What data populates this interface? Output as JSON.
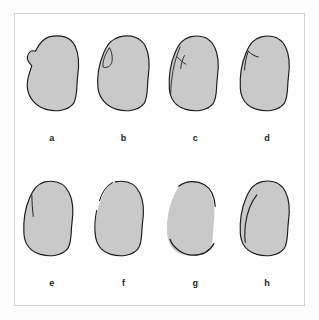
{
  "figure": {
    "background_color": "#fdfdfd",
    "frame_color": "#d2d2d2",
    "fill_color": "#c9c9c9",
    "outline_color": "#1a1a1a",
    "label_color": "#1d1d1d",
    "rows": 2,
    "columns": 4
  },
  "panels": [
    {
      "label": "a",
      "name": "seed-outline-a",
      "description": "full kidney-bean outline with concave notch on upper left margin",
      "outline": "M 46 8 C 62 4 76 8 82 20 C 88 32 88 48 86 62 C 84 78 86 92 80 101 C 72 111 56 113 42 109 C 28 105 18 94 16 80 C 14 66 20 56 22 48 C 18 44 15 40 16 35 C 17 29 22 26 27 28 C 30 22 36 11 46 8 Z",
      "marks": []
    },
    {
      "label": "b",
      "name": "seed-outline-b",
      "description": "bean outline with small pointed flap at upper left hilum",
      "outline": "M 44 8 C 60 4 74 9 80 21 C 86 33 86 49 84 63 C 82 79 84 92 78 101 C 70 111 54 113 40 109 C 26 105 16 94 14 80 C 12 62 16 44 22 30 C 28 16 34 11 44 8 Z",
      "marks": [
        "M 30 23 C 24 32 20 42 21 50 C 26 52 31 49 33 44 C 35 37 33 29 30 23 Z"
      ]
    },
    {
      "label": "c",
      "name": "seed-outline-c",
      "description": "bean outline with X-shaped cross mark and descending line at upper left",
      "outline": "M 42 8 C 58 4 70 10 76 22 C 82 34 82 50 80 64 C 78 80 80 92 74 101 C 66 111 50 113 36 109 C 22 105 14 94 13 80 C 12 62 15 44 21 30 C 27 16 32 11 42 8 Z",
      "marks": [
        "M 28 22 C 24 32 20 44 18 56 C 16 68 15 78 15 86",
        "M 24 36 C 28 40 32 44 36 46",
        "M 34 34 C 31 40 29 47 29 52"
      ]
    },
    {
      "label": "d",
      "name": "seed-outline-d",
      "description": "bean outline with small hook mark at upper left",
      "outline": "M 42 8 C 58 4 70 10 76 22 C 82 34 82 50 80 64 C 78 80 80 92 74 101 C 66 111 50 113 36 109 C 22 105 14 94 13 80 C 12 62 15 44 21 30 C 27 16 32 11 42 8 Z",
      "marks": [
        "M 24 28 C 21 36 19 46 19 54",
        "M 24 28 C 28 32 33 35 38 36"
      ]
    },
    {
      "label": "e",
      "name": "seed-outline-e",
      "description": "narrow bean outline with short vertical line inside upper left",
      "outline": "M 40 8 C 56 5 68 11 74 23 C 80 35 80 51 78 65 C 76 81 78 92 72 101 C 64 111 48 113 34 109 C 20 105 12 94 11 80 C 10 62 13 44 19 30 C 25 17 30 11 40 8 Z",
      "marks": [
        "M 22 26 C 22 36 23 46 24 56"
      ]
    },
    {
      "label": "f",
      "name": "seed-outline-f",
      "description": "bean outline with gap break in left margin and top margin",
      "outline": "M 38 8 C 54 5 66 11 72 23 C 78 35 78 51 76 65 C 74 81 76 92 70 101 C 62 111 46 113 32 109 C 18 105 11 94 10 80",
      "marks": [
        "M 10 80 C 9 70 10 58 12 48",
        "M 16 34 C 19 24 25 14 34 9"
      ]
    },
    {
      "label": "g",
      "name": "seed-outline-g",
      "description": "bean shape with only top and bottom arc outlines, left margin unmarked",
      "outline": "M 26 14 C 36 7 50 5 62 12 C 72 18 76 30 77 42",
      "marks": [
        "M 14 88 C 18 100 32 110 46 110 C 60 110 70 104 75 94"
      ]
    },
    {
      "label": "h",
      "name": "seed-outline-h",
      "description": "bean outline with long curved internal line parallel to left margin",
      "outline": "M 42 8 C 58 4 70 10 76 22 C 82 34 82 50 80 64 C 78 80 80 92 74 101 C 66 111 50 113 36 109 C 22 105 14 94 13 80 C 12 62 15 44 21 30 C 27 16 32 11 42 8 Z",
      "marks": [
        "M 36 26 C 28 36 22 52 20 68 C 19 78 19 86 20 92"
      ]
    }
  ]
}
